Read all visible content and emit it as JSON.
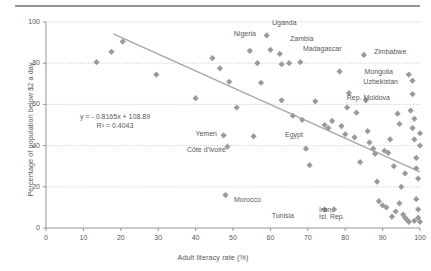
{
  "figure": {
    "top_rule_color": "#939598",
    "marker_color": "#9a9a9d",
    "trendline_color": "#a7a7aa",
    "axis_color": "#939598",
    "gridline_color": "#bcbcbe",
    "text_color": "#58585a"
  },
  "chart_data": {
    "type": "scatter",
    "title": "",
    "xlabel": "Adult literacy rate (%)",
    "ylabel": "Percentage of population below $2 a day",
    "xlim": [
      0,
      100
    ],
    "ylim": [
      0,
      100
    ],
    "xticks": [
      0,
      10,
      20,
      30,
      40,
      50,
      60,
      70,
      80,
      90,
      100
    ],
    "yticks": [
      0,
      20,
      40,
      60,
      80,
      100
    ],
    "grid": "horizontal-dotted",
    "legend": "none",
    "annotations": {
      "equation": "y = - 0.8165x + 108.89",
      "r_squared": "R² = 0.4043"
    },
    "trendline": {
      "slope": -0.8165,
      "intercept": 108.89,
      "x_start": 18,
      "x_end": 100
    },
    "points": [
      {
        "x": 13.5,
        "y": 80.5,
        "label": ""
      },
      {
        "x": 17.5,
        "y": 85.5,
        "label": ""
      },
      {
        "x": 20.5,
        "y": 90.5,
        "label": ""
      },
      {
        "x": 29.5,
        "y": 74.5,
        "label": ""
      },
      {
        "x": 40.0,
        "y": 63.0,
        "label": ""
      },
      {
        "x": 44.5,
        "y": 82.5,
        "label": ""
      },
      {
        "x": 46.5,
        "y": 77.5,
        "label": ""
      },
      {
        "x": 49.0,
        "y": 71.0,
        "label": ""
      },
      {
        "x": 51.0,
        "y": 58.5,
        "label": ""
      },
      {
        "x": 47.5,
        "y": 45.0,
        "label": "Yemen"
      },
      {
        "x": 48.5,
        "y": 39.5,
        "label": "Côte d'Ivoire"
      },
      {
        "x": 48.0,
        "y": 16.0,
        "label": "Morocco"
      },
      {
        "x": 54.5,
        "y": 86.0,
        "label": "Nigeria"
      },
      {
        "x": 56.5,
        "y": 80.0,
        "label": ""
      },
      {
        "x": 57.5,
        "y": 70.5,
        "label": ""
      },
      {
        "x": 55.5,
        "y": 44.5,
        "label": "Egypt"
      },
      {
        "x": 59.0,
        "y": 93.5,
        "label": "Uganda"
      },
      {
        "x": 60.0,
        "y": 86.5,
        "label": "Zambia"
      },
      {
        "x": 62.5,
        "y": 84.5,
        "label": "Madagascar"
      },
      {
        "x": 63.0,
        "y": 79.5,
        "label": ""
      },
      {
        "x": 65.0,
        "y": 80.0,
        "label": ""
      },
      {
        "x": 63.0,
        "y": 62.0,
        "label": ""
      },
      {
        "x": 66.0,
        "y": 54.5,
        "label": ""
      },
      {
        "x": 68.5,
        "y": 52.5,
        "label": ""
      },
      {
        "x": 69.5,
        "y": 38.5,
        "label": ""
      },
      {
        "x": 70.5,
        "y": 30.5,
        "label": ""
      },
      {
        "x": 72.0,
        "y": 61.5,
        "label": ""
      },
      {
        "x": 74.5,
        "y": 50.0,
        "label": ""
      },
      {
        "x": 75.5,
        "y": 48.5,
        "label": ""
      },
      {
        "x": 76.5,
        "y": 52.0,
        "label": ""
      },
      {
        "x": 74.5,
        "y": 9.0,
        "label": "Tunisia"
      },
      {
        "x": 77.0,
        "y": 9.0,
        "label": "Iran, Isl. Rep."
      },
      {
        "x": 79.0,
        "y": 49.5,
        "label": ""
      },
      {
        "x": 80.0,
        "y": 45.5,
        "label": ""
      },
      {
        "x": 82.5,
        "y": 44.0,
        "label": ""
      },
      {
        "x": 84.0,
        "y": 32.0,
        "label": ""
      },
      {
        "x": 85.0,
        "y": 84.0,
        "label": "Zimbabwe"
      },
      {
        "x": 86.0,
        "y": 47.0,
        "label": ""
      },
      {
        "x": 86.5,
        "y": 41.5,
        "label": ""
      },
      {
        "x": 87.5,
        "y": 38.5,
        "label": ""
      },
      {
        "x": 88.0,
        "y": 36.0,
        "label": ""
      },
      {
        "x": 88.5,
        "y": 22.5,
        "label": ""
      },
      {
        "x": 89.0,
        "y": 13.0,
        "label": ""
      },
      {
        "x": 90.0,
        "y": 11.0,
        "label": ""
      },
      {
        "x": 91.0,
        "y": 10.0,
        "label": ""
      },
      {
        "x": 90.5,
        "y": 37.5,
        "label": ""
      },
      {
        "x": 91.5,
        "y": 36.5,
        "label": ""
      },
      {
        "x": 92.0,
        "y": 43.0,
        "label": ""
      },
      {
        "x": 93.0,
        "y": 30.0,
        "label": ""
      },
      {
        "x": 94.0,
        "y": 55.5,
        "label": ""
      },
      {
        "x": 94.5,
        "y": 50.5,
        "label": ""
      },
      {
        "x": 95.0,
        "y": 20.0,
        "label": ""
      },
      {
        "x": 95.5,
        "y": 6.5,
        "label": ""
      },
      {
        "x": 96.0,
        "y": 5.0,
        "label": ""
      },
      {
        "x": 96.5,
        "y": 4.0,
        "label": ""
      },
      {
        "x": 97.0,
        "y": 74.5,
        "label": "Mongolia"
      },
      {
        "x": 98.0,
        "y": 71.5,
        "label": "Uzbekistan"
      },
      {
        "x": 98.0,
        "y": 65.0,
        "label": "Rep. Moldova"
      },
      {
        "x": 97.5,
        "y": 57.0,
        "label": ""
      },
      {
        "x": 98.5,
        "y": 53.0,
        "label": ""
      },
      {
        "x": 98.0,
        "y": 48.5,
        "label": ""
      },
      {
        "x": 98.5,
        "y": 43.0,
        "label": ""
      },
      {
        "x": 99.0,
        "y": 34.0,
        "label": ""
      },
      {
        "x": 99.0,
        "y": 29.0,
        "label": ""
      },
      {
        "x": 99.5,
        "y": 24.0,
        "label": ""
      },
      {
        "x": 99.0,
        "y": 14.0,
        "label": ""
      },
      {
        "x": 99.5,
        "y": 9.0,
        "label": ""
      },
      {
        "x": 99.5,
        "y": 5.0,
        "label": ""
      },
      {
        "x": 100.0,
        "y": 3.0,
        "label": ""
      },
      {
        "x": 98.5,
        "y": 3.5,
        "label": ""
      },
      {
        "x": 97.0,
        "y": 3.0,
        "label": ""
      },
      {
        "x": 92.5,
        "y": 5.5,
        "label": ""
      },
      {
        "x": 93.5,
        "y": 8.0,
        "label": ""
      },
      {
        "x": 94.5,
        "y": 12.0,
        "label": ""
      },
      {
        "x": 96.0,
        "y": 26.5,
        "label": ""
      },
      {
        "x": 100.0,
        "y": 46.0,
        "label": ""
      },
      {
        "x": 100.0,
        "y": 40.0,
        "label": ""
      },
      {
        "x": 85.5,
        "y": 62.0,
        "label": ""
      },
      {
        "x": 80.5,
        "y": 58.5,
        "label": ""
      },
      {
        "x": 83.0,
        "y": 56.0,
        "label": ""
      },
      {
        "x": 81.0,
        "y": 65.5,
        "label": ""
      },
      {
        "x": 78.5,
        "y": 76.0,
        "label": ""
      },
      {
        "x": 68.0,
        "y": 80.5,
        "label": ""
      }
    ]
  },
  "axis_labels": {
    "x": [
      "0",
      "10",
      "20",
      "30",
      "40",
      "50",
      "60",
      "70",
      "80",
      "90",
      "100"
    ],
    "y": [
      "0",
      "20",
      "40",
      "60",
      "80",
      "100"
    ]
  },
  "point_labels": [
    {
      "text": "Uganda",
      "x": 272,
      "y": 19,
      "align": "left"
    },
    {
      "text": "Nigeria",
      "x": 256,
      "y": 30,
      "align": "right"
    },
    {
      "text": "Zambia",
      "x": 290,
      "y": 35,
      "align": "left"
    },
    {
      "text": "Madagascar",
      "x": 303,
      "y": 45,
      "align": "left"
    },
    {
      "text": "Zimbabwe",
      "x": 374,
      "y": 48,
      "align": "left"
    },
    {
      "text": "Mongolia",
      "x": 393,
      "y": 68,
      "align": "right"
    },
    {
      "text": "Uzbekistan",
      "x": 398,
      "y": 78,
      "align": "right"
    },
    {
      "text": "Rep. Moldova",
      "x": 390,
      "y": 94,
      "align": "right"
    },
    {
      "text": "Yemen",
      "x": 217,
      "y": 130,
      "align": "right"
    },
    {
      "text": "Egypt",
      "x": 285,
      "y": 131,
      "align": "left"
    },
    {
      "text": "Côte d'Ivoire",
      "x": 226,
      "y": 146,
      "align": "right"
    },
    {
      "text": "Morocco",
      "x": 234,
      "y": 196,
      "align": "left"
    },
    {
      "text": "Tunisia",
      "x": 294,
      "y": 212,
      "align": "right"
    },
    {
      "text": "Iran,",
      "x": 319,
      "y": 206,
      "align": "left"
    },
    {
      "text": "Isl. Rep.",
      "x": 319,
      "y": 213,
      "align": "left"
    }
  ]
}
